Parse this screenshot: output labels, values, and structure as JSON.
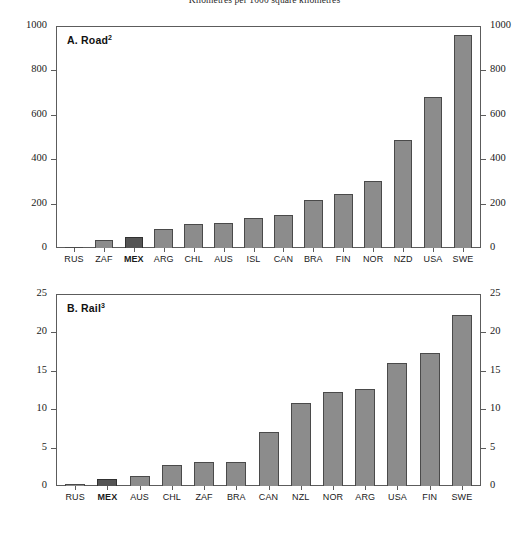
{
  "figure": {
    "super_title": "Kilometres per 1000 square kilometres"
  },
  "chart_data": [
    {
      "type": "bar",
      "panel": "A",
      "title": "A. Road",
      "title_footnote": "2",
      "categories": [
        "RUS",
        "ZAF",
        "MEX",
        "ARG",
        "CHL",
        "AUS",
        "ISL",
        "CAN",
        "BRA",
        "FIN",
        "NOR",
        "NZD",
        "USA",
        "SWE"
      ],
      "values": [
        5,
        35,
        48,
        85,
        110,
        113,
        133,
        148,
        218,
        245,
        300,
        485,
        680,
        960
      ],
      "highlight": "MEX",
      "xlabel": "",
      "ylabel": "",
      "ylim": [
        0,
        1000
      ],
      "yticks": [
        0,
        200,
        400,
        600,
        800,
        1000
      ],
      "ytick_labels": [
        "0",
        "200",
        "400",
        "600",
        "800",
        "1000"
      ],
      "grid": false,
      "legend": "none",
      "right_axis": true
    },
    {
      "type": "bar",
      "panel": "B",
      "title": "B. Rail",
      "title_footnote": "3",
      "categories": [
        "RUS",
        "MEX",
        "AUS",
        "CHL",
        "ZAF",
        "BRA",
        "CAN",
        "NZL",
        "NOR",
        "ARG",
        "USA",
        "FIN",
        "SWE"
      ],
      "values": [
        0.2,
        0.9,
        1.3,
        2.8,
        3.1,
        3.15,
        7.0,
        10.8,
        12.3,
        12.6,
        16.0,
        17.3,
        22.3
      ],
      "highlight": "MEX",
      "xlabel": "",
      "ylabel": "",
      "ylim": [
        0,
        25
      ],
      "yticks": [
        0,
        5,
        10,
        15,
        20,
        25
      ],
      "ytick_labels": [
        "0",
        "5",
        "10",
        "15",
        "20",
        "25"
      ],
      "grid": false,
      "legend": "none",
      "right_axis": true
    }
  ],
  "colors": {
    "bar": "#8c8c8c",
    "bar_highlight": "#545454",
    "axis": "#5c5c5c",
    "text": "#1a1a1a"
  }
}
